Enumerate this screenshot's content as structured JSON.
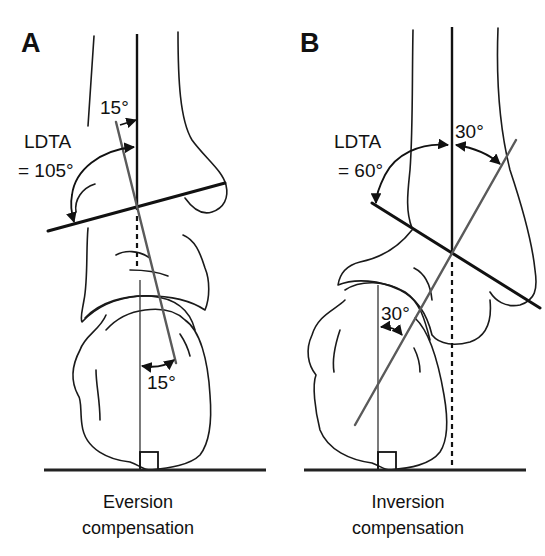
{
  "panels": [
    {
      "id": "A",
      "label": "A",
      "ldta_label": "LDTA",
      "ldta_value": "= 105°",
      "tibial_angle": "15°",
      "heel_angle": "15°",
      "caption_line1": "Eversion",
      "caption_line2": "compensation"
    },
    {
      "id": "B",
      "label": "B",
      "ldta_label": "LDTA",
      "ldta_value": "= 60°",
      "tibial_angle": "30°",
      "heel_angle": "30°",
      "caption_line1": "Inversion",
      "caption_line2": "compensation"
    }
  ],
  "colors": {
    "line": "#111111",
    "axis_gray": "#5a5a5a",
    "background": "#ffffff"
  }
}
